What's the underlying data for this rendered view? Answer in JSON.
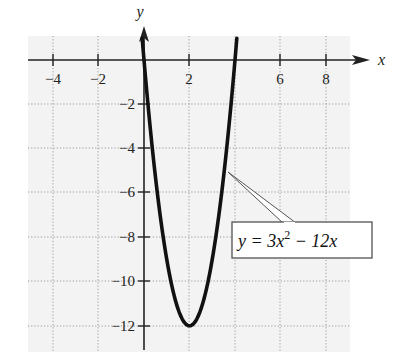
{
  "chart_data": {
    "type": "line",
    "title": "",
    "xlabel": "x",
    "ylabel": "y",
    "xlim": [
      -5,
      9
    ],
    "ylim": [
      -13,
      1
    ],
    "grid": true,
    "x_ticks": [
      -4,
      -2,
      2,
      6,
      8
    ],
    "x_tick_labels": [
      "−4",
      "−2",
      "2",
      "6",
      "8"
    ],
    "y_ticks": [
      -2,
      -4,
      -6,
      -8,
      -10,
      -12
    ],
    "y_tick_labels": [
      "−2",
      "−4",
      "−6",
      "−8",
      "−10",
      "−12"
    ],
    "series": [
      {
        "name": "y = 3x^2 − 12x",
        "function": "3*x^2 - 12*x",
        "x": [
          -0.08,
          0,
          0.5,
          1,
          1.5,
          2,
          2.5,
          3,
          3.5,
          4,
          4.08
        ],
        "y": [
          0.98,
          0,
          -5.25,
          -9,
          -11.25,
          -12,
          -11.25,
          -9,
          -5.25,
          0,
          0.98
        ]
      }
    ],
    "annotations": [
      {
        "text_parts": {
          "lhs": "y = 3x",
          "exp": "2",
          "rhs": " − 12x"
        },
        "points_to": [
          3.6,
          -3.7
        ]
      }
    ],
    "legend": null
  },
  "labels": {
    "x_axis": "x",
    "y_axis": "y",
    "eq_lhs": "y = 3x",
    "eq_exp": "2",
    "eq_rhs": " − 12x",
    "xt0": "−4",
    "xt1": "−2",
    "xt2": "2",
    "xt3": "6",
    "xt4": "8",
    "yt0": "−2",
    "yt1": "−4",
    "yt2": "−6",
    "yt3": "−8",
    "yt4": "−10",
    "yt5": "−12"
  }
}
